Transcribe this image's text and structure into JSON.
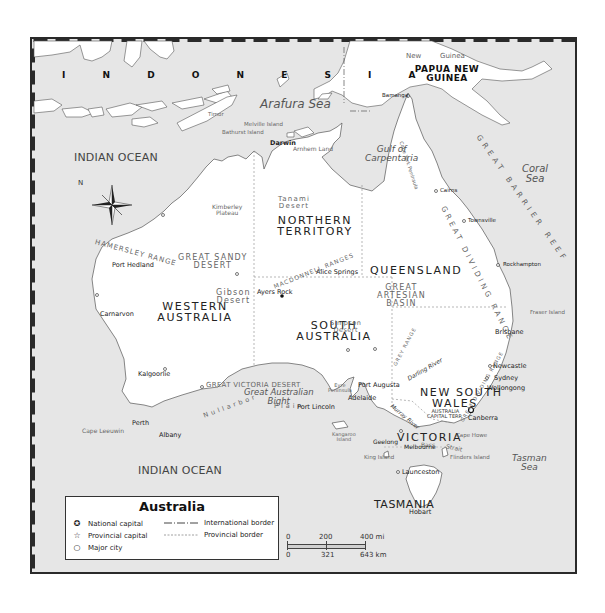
{
  "map": {
    "title": "Australia",
    "colors": {
      "water": "#e6e6e6",
      "land": "#ffffff",
      "coast": "#555555",
      "frame": "#2a2a2a",
      "text": "#333333"
    },
    "countries": [
      {
        "label": "INDONESIA",
        "display": "I  N  D  O  N  E  S  I  A"
      },
      {
        "label": "PAPUA NEW GUINEA",
        "line1": "PAPUA NEW",
        "line2": "GUINEA"
      }
    ],
    "island_labels": {
      "new": "New",
      "guinea": "Guinea",
      "timor": "Timor",
      "melville": "Melville Island",
      "bathurst": "Bathurst Island",
      "kangaroo1": "Kangaroo",
      "kangaroo2": "Island",
      "king": "King Island",
      "flinders": "Flinders Island",
      "fraser": "Fraser Island"
    },
    "water_bodies": {
      "arafura": "Arafura Sea",
      "gulf1": "Gulf of",
      "gulf2": "Carpentaria",
      "coral1": "Coral",
      "coral2": "Sea",
      "indian_ocean_north": "INDIAN OCEAN",
      "indian_ocean_south": "INDIAN OCEAN",
      "bight1": "Great Australian",
      "bight2": "Bight",
      "tasman1": "Tasman",
      "tasman2": "Sea",
      "bass": "Bass",
      "strait": "Strait"
    },
    "states": {
      "nt1": "NORTHERN",
      "nt2": "TERRITORY",
      "wa1": "WESTERN",
      "wa2": "AUSTRALIA",
      "sa1": "SOUTH",
      "sa2": "AUSTRALIA",
      "qld": "QUEENSLAND",
      "nsw1": "NEW SOUTH",
      "nsw2": "WALES",
      "vic": "VICTORIA",
      "tas": "TASMANIA",
      "act1": "AUSTRALIA",
      "act2": "CAPITAL TERR."
    },
    "regions": {
      "kimberley1": "Kimberley",
      "kimberley2": "Plateau",
      "tanami1": "Tanami",
      "tanami2": "Desert",
      "sandy1": "GREAT SANDY",
      "sandy2": "DESERT",
      "gibson1": "Gibson",
      "gibson2": "Desert",
      "victoria_desert": "GREAT VICTORIA DESERT",
      "nullarbor": "Nullarbor",
      "plain": "Plain",
      "simpson1": "Simpson",
      "simpson2": "Desert",
      "artesian1": "GREAT",
      "artesian2": "ARTESIAN",
      "artesian3": "BASIN",
      "arnhem": "Arnhem Land",
      "cape_york": "Cape York Peninsula",
      "eyre1": "Eyre",
      "eyre2": "Peninsula"
    },
    "ranges": {
      "hamersley": "HAMERSLEY RANGE",
      "macdonnell": "MACDONNELL RANGES",
      "barrier_reef": "GREAT BARRIER REEF",
      "dividing_qld": "GREAT DIVIDING RANGE",
      "dividing_nsw": "GREAT DIVIDING RANGE",
      "grey": "GREY RANGE"
    },
    "rivers": {
      "darling": "Darling River",
      "murray": "Murray River"
    },
    "cities": [
      {
        "name": "Darwin",
        "type": "provincial-capital"
      },
      {
        "name": "Bamanga",
        "type": "major-city"
      },
      {
        "name": "Cairns",
        "type": "major-city"
      },
      {
        "name": "Townsville",
        "type": "major-city"
      },
      {
        "name": "Rockhampton",
        "type": "major-city"
      },
      {
        "name": "Brisbane",
        "type": "provincial-capital"
      },
      {
        "name": "Newcastle",
        "type": "major-city"
      },
      {
        "name": "Sydney",
        "type": "provincial-capital"
      },
      {
        "name": "Wollongong",
        "type": "major-city"
      },
      {
        "name": "Canberra",
        "type": "national-capital"
      },
      {
        "name": "Melbourne",
        "type": "provincial-capital"
      },
      {
        "name": "Geelong",
        "type": "major-city"
      },
      {
        "name": "Cape Howe",
        "type": "cape"
      },
      {
        "name": "Launceston",
        "type": "major-city"
      },
      {
        "name": "Hobart",
        "type": "provincial-capital"
      },
      {
        "name": "Adelaide",
        "type": "provincial-capital"
      },
      {
        "name": "Port Augusta",
        "type": "major-city"
      },
      {
        "name": "Port Lincoln",
        "type": "major-city"
      },
      {
        "name": "Alice Springs",
        "type": "major-city"
      },
      {
        "name": "Ayers Rock",
        "type": "landmark"
      },
      {
        "name": "Port Hedland",
        "type": "major-city"
      },
      {
        "name": "Carnarvon",
        "type": "major-city"
      },
      {
        "name": "Kalgoorlie",
        "type": "major-city"
      },
      {
        "name": "Perth",
        "type": "provincial-capital"
      },
      {
        "name": "Albany",
        "type": "major-city"
      },
      {
        "name": "Cape Leeuwin",
        "type": "cape"
      }
    ],
    "compass": {
      "label": "N"
    }
  },
  "legend": {
    "title": "Australia",
    "items": [
      {
        "symbol": "national-capital",
        "glyph": "✪",
        "label": "National capital"
      },
      {
        "symbol": "provincial-capital",
        "glyph": "☆",
        "label": "Provincial capital"
      },
      {
        "symbol": "major-city",
        "glyph": "○",
        "label": "Major city"
      },
      {
        "symbol": "international-border",
        "label": "International border"
      },
      {
        "symbol": "provincial-border",
        "label": "Provincial border"
      }
    ]
  },
  "scale": {
    "miles": [
      "0",
      "200",
      "400 mi"
    ],
    "km": [
      "0",
      "321",
      "643 km"
    ]
  }
}
